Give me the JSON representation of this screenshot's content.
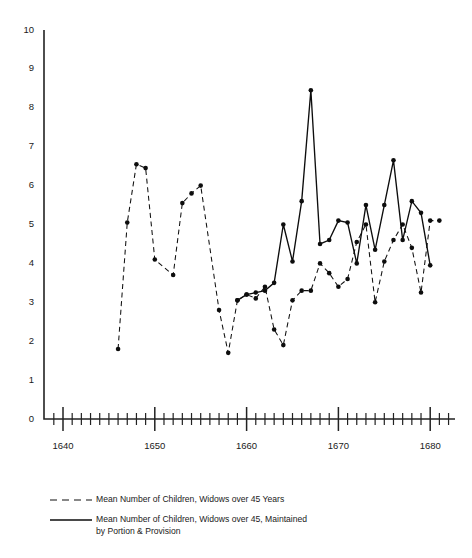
{
  "chart_data": {
    "type": "line",
    "title": "",
    "subtitle": "",
    "xlabel": "",
    "ylabel": "",
    "xlim": [
      1638,
      1683
    ],
    "ylim": [
      0,
      10
    ],
    "grid": false,
    "legend_position": "bottom-left",
    "y_ticks": [
      0,
      1,
      2,
      3,
      4,
      5,
      6,
      7,
      8,
      9,
      10
    ],
    "y_tick_labels": [
      "0",
      "1",
      "2",
      "3",
      "4",
      "5",
      "6",
      "7",
      "8",
      "9",
      "10"
    ],
    "x_major_ticks": [
      1640,
      1650,
      1660,
      1670,
      1680
    ],
    "x_major_tick_labels": [
      "1640",
      "1650",
      "1660",
      "1670",
      "1680"
    ],
    "x_minor_tick_start": 1639,
    "x_minor_tick_end": 1682,
    "series": [
      {
        "name": "Mean Number of Children, Widows over 45 Years",
        "style": "dashed",
        "marker": "circle",
        "x": [
          1646,
          1647,
          1648,
          1649,
          1650,
          1652,
          1653,
          1654,
          1655,
          1657,
          1658,
          1659,
          1660,
          1661,
          1662,
          1663,
          1664,
          1665,
          1666,
          1667,
          1668,
          1669,
          1670,
          1671,
          1672,
          1673,
          1674,
          1675,
          1676,
          1677,
          1678,
          1679,
          1680,
          1681
        ],
        "y": [
          1.8,
          5.05,
          6.55,
          6.45,
          4.1,
          3.7,
          5.55,
          5.8,
          6.0,
          2.8,
          1.7,
          3.05,
          3.2,
          3.1,
          3.4,
          2.3,
          1.9,
          3.05,
          3.3,
          3.3,
          4.0,
          3.75,
          3.4,
          3.6,
          4.55,
          5.0,
          3.0,
          4.05,
          4.6,
          5.0,
          4.4,
          3.25,
          5.1,
          5.1
        ]
      },
      {
        "name": "Mean Number of Children, Widows over 45, Maintained by Portion & Provision",
        "style": "solid",
        "marker": "circle",
        "x": [
          1659,
          1660,
          1661,
          1662,
          1663,
          1664,
          1665,
          1666,
          1667,
          1668,
          1669,
          1670,
          1671,
          1672,
          1673,
          1674,
          1675,
          1676,
          1677,
          1678,
          1679,
          1680
        ],
        "y": [
          3.05,
          3.2,
          3.25,
          3.3,
          3.5,
          5.0,
          4.05,
          5.6,
          8.45,
          4.5,
          4.6,
          5.1,
          5.05,
          4.0,
          5.5,
          4.35,
          5.5,
          6.65,
          4.6,
          5.6,
          5.3,
          3.95
        ]
      }
    ],
    "legend": [
      {
        "style": "dashed",
        "lines": [
          "Mean Number of Children, Widows over 45 Years"
        ]
      },
      {
        "style": "solid",
        "lines": [
          "Mean Number of Children, Widows over 45, Maintained",
          "by Portion & Provision"
        ]
      }
    ]
  }
}
